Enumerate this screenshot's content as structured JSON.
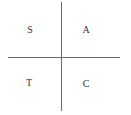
{
  "diagram": {
    "type": "quadrant-sign-diagram",
    "quadrants": [
      {
        "position": "top-left",
        "label": "S"
      },
      {
        "position": "top-right",
        "label": "A"
      },
      {
        "position": "bottom-left",
        "label": "T"
      },
      {
        "position": "bottom-right",
        "label": "C"
      }
    ],
    "colors": {
      "axis": "#6a6a6a",
      "text": "#333333",
      "background": "#ffffff"
    }
  }
}
